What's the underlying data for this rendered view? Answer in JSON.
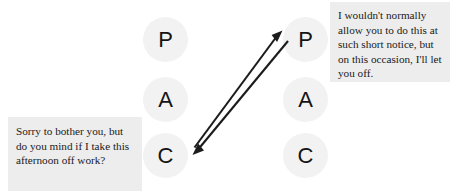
{
  "diagram": {
    "type": "transactional-analysis-crossed-transaction",
    "columns": [
      {
        "id": "self",
        "role": "initiator",
        "states": [
          {
            "code": "P",
            "name": "Parent"
          },
          {
            "code": "A",
            "name": "Adult"
          },
          {
            "code": "C",
            "name": "Child"
          }
        ]
      },
      {
        "id": "other",
        "role": "responder",
        "states": [
          {
            "code": "P",
            "name": "Parent"
          },
          {
            "code": "A",
            "name": "Adult"
          },
          {
            "code": "C",
            "name": "Child"
          }
        ]
      }
    ],
    "arrows": [
      {
        "id": "stimulus",
        "label": "child-to-parent-stimulus",
        "from": "self.C",
        "to": "other.P",
        "direction": "up-right"
      },
      {
        "id": "response",
        "label": "parent-to-child-response",
        "from": "other.P",
        "to": "self.C",
        "direction": "down-left"
      }
    ],
    "colors": {
      "background": "#ffffff",
      "circle_fill": "#f2f2f2",
      "letter": "#141414",
      "caption_background": "#ededed",
      "caption_text": "#1a1a1a",
      "arrow": "#1c1c1c"
    }
  },
  "captions": {
    "request": "Sorry to bother you, but do you mind if I take this afternoon off work?",
    "response": "I wouldn't normally allow you to do this at such short notice, but on this occasion, I'll let you off."
  }
}
